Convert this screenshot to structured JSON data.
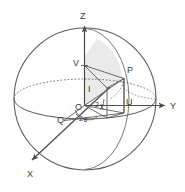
{
  "figure": {
    "type": "poincare-sphere-diagram",
    "title": "",
    "background_color": "#ffffff",
    "line_color": "#555555",
    "shade_color": "#e2e2e2",
    "label_color": "#3a3a3a"
  },
  "axes": [
    {
      "id": "z",
      "label": "Z",
      "direction": "up",
      "arrow": true
    },
    {
      "id": "y",
      "label": "Y",
      "direction": "right",
      "arrow": true
    },
    {
      "id": "x",
      "label": "X",
      "direction": "down-left",
      "arrow": true
    }
  ],
  "points": [
    {
      "id": "o",
      "label": "O",
      "role": "origin"
    },
    {
      "id": "p",
      "label": "P",
      "role": "point-on-sphere"
    },
    {
      "id": "v",
      "label": "V",
      "role": "z-axis-projection"
    },
    {
      "id": "u",
      "label": "U",
      "role": "equator-projection"
    },
    {
      "id": "q",
      "label": "Q",
      "role": "x-axis-projection"
    },
    {
      "id": "i",
      "label": "I",
      "role": "vertical-segment-label"
    }
  ],
  "angles": [
    {
      "id": "chi",
      "label": "2",
      "symbol": "χ",
      "full": "2χ",
      "between": "OU and OP"
    },
    {
      "id": "theta",
      "label": "2",
      "symbol": "θ",
      "full": "2θ",
      "between": "OQ and OU"
    }
  ],
  "sphere": {
    "outline": "great-circle",
    "equator_front": "solid",
    "equator_back": "dotted",
    "meridian_through_p": "solid-arc",
    "shaded_sector": "O-V-P arc sector"
  }
}
